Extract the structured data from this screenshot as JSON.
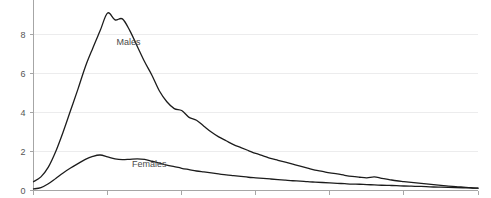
{
  "chart_data": {
    "type": "line",
    "title": "",
    "xlabel": "",
    "ylabel": "",
    "ylim": [
      0,
      9.6
    ],
    "xlim": [
      0,
      60
    ],
    "grid": true,
    "legend_position": "inline-annotation",
    "y_ticks": [
      0,
      2,
      4,
      6,
      8
    ],
    "y_tick_labels": [
      "0",
      "2",
      "4",
      "6",
      "8"
    ],
    "x_ticks": [
      0,
      10,
      20,
      30,
      40,
      50,
      60
    ],
    "x_tick_labels": [
      "",
      "",
      "",
      "",
      "",
      "",
      ""
    ],
    "annotations": [
      {
        "text": "Males",
        "x": 11.2,
        "y": 7.45
      },
      {
        "text": "Females",
        "x": 13.3,
        "y": 1.2
      }
    ],
    "x": [
      0,
      1,
      2,
      3,
      4,
      5,
      6,
      7,
      8,
      9,
      10,
      11,
      12,
      13,
      14,
      15,
      16,
      17,
      18,
      19,
      20,
      21,
      22,
      23,
      24,
      25,
      26,
      27,
      28,
      29,
      30,
      31,
      32,
      33,
      34,
      35,
      36,
      37,
      38,
      39,
      40,
      41,
      42,
      43,
      44,
      45,
      46,
      47,
      48,
      49,
      50,
      51,
      52,
      53,
      54,
      55,
      56,
      57,
      58,
      59,
      60
    ],
    "series": [
      {
        "name": "Males",
        "color": "#1c1c1c",
        "values": [
          0.45,
          0.7,
          1.2,
          2.0,
          3.0,
          4.1,
          5.2,
          6.35,
          7.3,
          8.2,
          9.1,
          8.75,
          8.8,
          8.2,
          7.4,
          6.6,
          5.9,
          5.1,
          4.55,
          4.2,
          4.1,
          3.75,
          3.6,
          3.3,
          3.0,
          2.75,
          2.55,
          2.35,
          2.2,
          2.05,
          1.9,
          1.78,
          1.65,
          1.55,
          1.45,
          1.35,
          1.25,
          1.15,
          1.05,
          0.98,
          0.9,
          0.85,
          0.78,
          0.72,
          0.68,
          0.65,
          0.7,
          0.62,
          0.56,
          0.5,
          0.46,
          0.42,
          0.38,
          0.34,
          0.3,
          0.26,
          0.22,
          0.2,
          0.17,
          0.14,
          0.12
        ]
      },
      {
        "name": "Females",
        "color": "#1c1c1c",
        "values": [
          0.08,
          0.15,
          0.35,
          0.62,
          0.9,
          1.15,
          1.38,
          1.6,
          1.75,
          1.82,
          1.72,
          1.62,
          1.58,
          1.6,
          1.62,
          1.6,
          1.5,
          1.4,
          1.3,
          1.22,
          1.14,
          1.07,
          1.0,
          0.95,
          0.9,
          0.85,
          0.8,
          0.76,
          0.72,
          0.68,
          0.65,
          0.62,
          0.59,
          0.56,
          0.53,
          0.5,
          0.48,
          0.45,
          0.43,
          0.41,
          0.39,
          0.37,
          0.35,
          0.33,
          0.32,
          0.3,
          0.29,
          0.27,
          0.26,
          0.25,
          0.23,
          0.22,
          0.21,
          0.2,
          0.18,
          0.17,
          0.16,
          0.15,
          0.14,
          0.13,
          0.12
        ]
      }
    ]
  },
  "colors": {
    "line": "#1c1c1c",
    "grid": "#ececed",
    "axis": "#a6a6a6",
    "tick_text": "#555555",
    "label_text": "#4a4a4a",
    "background": "#ffffff"
  }
}
